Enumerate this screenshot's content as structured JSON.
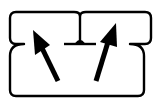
{
  "diagram": {
    "colors": {
      "stroke": "#000000",
      "background": "#ffffff"
    },
    "arrows": [
      {
        "name": "left-arrow",
        "direction": "up-left"
      },
      {
        "name": "right-arrow",
        "direction": "up-right"
      }
    ]
  }
}
